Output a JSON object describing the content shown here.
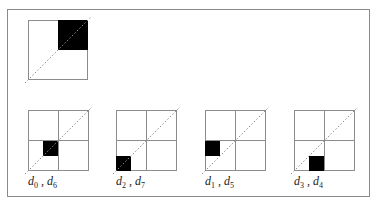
{
  "figure": {
    "line_color": "#8c8c8c",
    "fill_color": "#000000",
    "top_panel": {
      "description": "2x2 block with upper-right quadrant filled; dotted diagonal",
      "filled_quadrant": "upper-right"
    },
    "panels": [
      {
        "label_var1": "d",
        "label_sub1": "0",
        "label_var2": "d",
        "label_sub2": "6",
        "filled_cell": "row 2, col 1 (4x4 grid)"
      },
      {
        "label_var1": "d",
        "label_sub1": "2",
        "label_var2": "d",
        "label_sub2": "7",
        "filled_cell": "row 3, col 0 (4x4 grid)"
      },
      {
        "label_var1": "d",
        "label_sub1": "1",
        "label_var2": "d",
        "label_sub2": "5",
        "filled_cell": "row 2, col 0 (4x4 grid)"
      },
      {
        "label_var1": "d",
        "label_sub1": "3",
        "label_var2": "d",
        "label_sub2": "4",
        "filled_cell": "row 3, col 1 (4x4 grid)"
      }
    ],
    "separator": ","
  }
}
